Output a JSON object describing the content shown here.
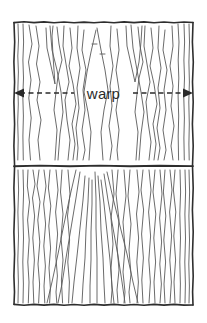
{
  "figure": {
    "kind": "hand-drawn-textile-weave-diagram",
    "background_color": "#ffffff",
    "ink_color": "#3a3a3a",
    "frame_color": "#2e2e2e",
    "thread_color": "#555555",
    "annotation": {
      "label": "warp",
      "label_color": "#2b2b2b",
      "arrow_style": "double-headed-dashed",
      "arrow_left_x": 14,
      "arrow_right_x": 193,
      "arrow_y": 93
    },
    "frame": {
      "left": 14,
      "top": 22,
      "right": 193,
      "bottom": 305,
      "divider_y": 166
    },
    "sections": [
      {
        "name": "upper-panel",
        "description": "zigzag warp threads forming peaked M and N shapes"
      },
      {
        "name": "lower-panel",
        "description": "vertical wavy warp threads converging in a central fan"
      }
    ]
  }
}
